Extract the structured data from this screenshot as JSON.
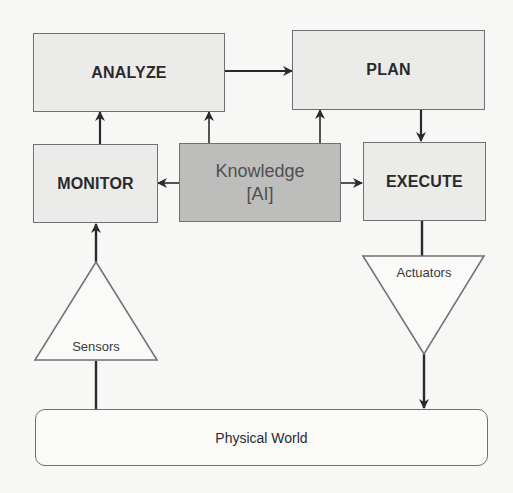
{
  "diagram": {
    "type": "MAPE-K autonomic control loop",
    "nodes": {
      "analyze": {
        "label": "ANALYZE"
      },
      "plan": {
        "label": "PLAN"
      },
      "monitor": {
        "label": "MONITOR"
      },
      "execute": {
        "label": "EXECUTE"
      },
      "knowledge": {
        "line1": "Knowledge",
        "line2": "[AI]"
      },
      "sensors": {
        "label": "Sensors"
      },
      "actuators": {
        "label": "Actuators"
      },
      "physical_world": {
        "label": "Physical World"
      }
    },
    "edges": [
      {
        "from": "physical_world",
        "to": "sensors"
      },
      {
        "from": "sensors",
        "to": "monitor"
      },
      {
        "from": "monitor",
        "to": "analyze"
      },
      {
        "from": "analyze",
        "to": "plan"
      },
      {
        "from": "plan",
        "to": "execute"
      },
      {
        "from": "execute",
        "to": "actuators"
      },
      {
        "from": "actuators",
        "to": "physical_world"
      },
      {
        "from": "knowledge",
        "to": "monitor"
      },
      {
        "from": "knowledge",
        "to": "analyze"
      },
      {
        "from": "knowledge",
        "to": "plan"
      },
      {
        "from": "knowledge",
        "to": "execute"
      }
    ],
    "colors": {
      "box_fill": "#ebebea",
      "knowledge_fill": "#bdbdbc",
      "border": "#707070",
      "arrow": "#2a2a2a",
      "background": "#f7f7f5"
    }
  }
}
